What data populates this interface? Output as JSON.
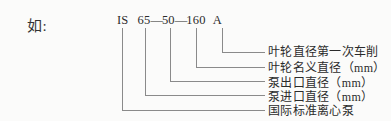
{
  "figure": {
    "intro_label": "如:",
    "model_code": {
      "series": "IS",
      "inlet": "65",
      "dash1": "—",
      "outlet": "50",
      "dash2": "—",
      "impeller": "160",
      "suffix": "A"
    },
    "callouts": [
      {
        "id": "impeller-trim",
        "text": "叶轮直径第一次车削"
      },
      {
        "id": "impeller-nominal-diameter",
        "text": "叶轮名义直径（mm）"
      },
      {
        "id": "pump-outlet-diameter",
        "text": "泵出口直径（mm）"
      },
      {
        "id": "pump-inlet-diameter",
        "text": "泵进口直径（mm）"
      },
      {
        "id": "international-standard-centrifugal-pump",
        "text": "国际标准离心泵"
      }
    ],
    "colors": {
      "background": "#fbfbfa",
      "text": "#2b2b2b",
      "leader_line": "#8a8a8a"
    }
  }
}
